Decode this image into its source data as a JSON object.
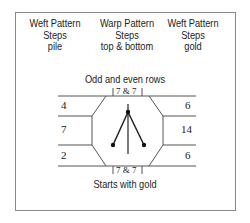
{
  "headers": [
    {
      "line1": "Weft Pattern",
      "line2": "Steps",
      "line3": "pile"
    },
    {
      "line1": "Warp Pattern",
      "line2": "Steps",
      "line3": "top & bottom"
    },
    {
      "line1": "Weft Pattern",
      "line2": "Steps",
      "line3": "gold"
    }
  ],
  "subtitle": "Odd and even rows",
  "top_label": "7 & 7",
  "bottom_label": "7 & 7",
  "left_values": [
    "4",
    "7",
    "2"
  ],
  "right_values": [
    "6",
    "14",
    "6"
  ],
  "caption": "Starts with gold",
  "colors": {
    "line": "#555555",
    "text": "#222222",
    "border": "#8a8a8a"
  }
}
